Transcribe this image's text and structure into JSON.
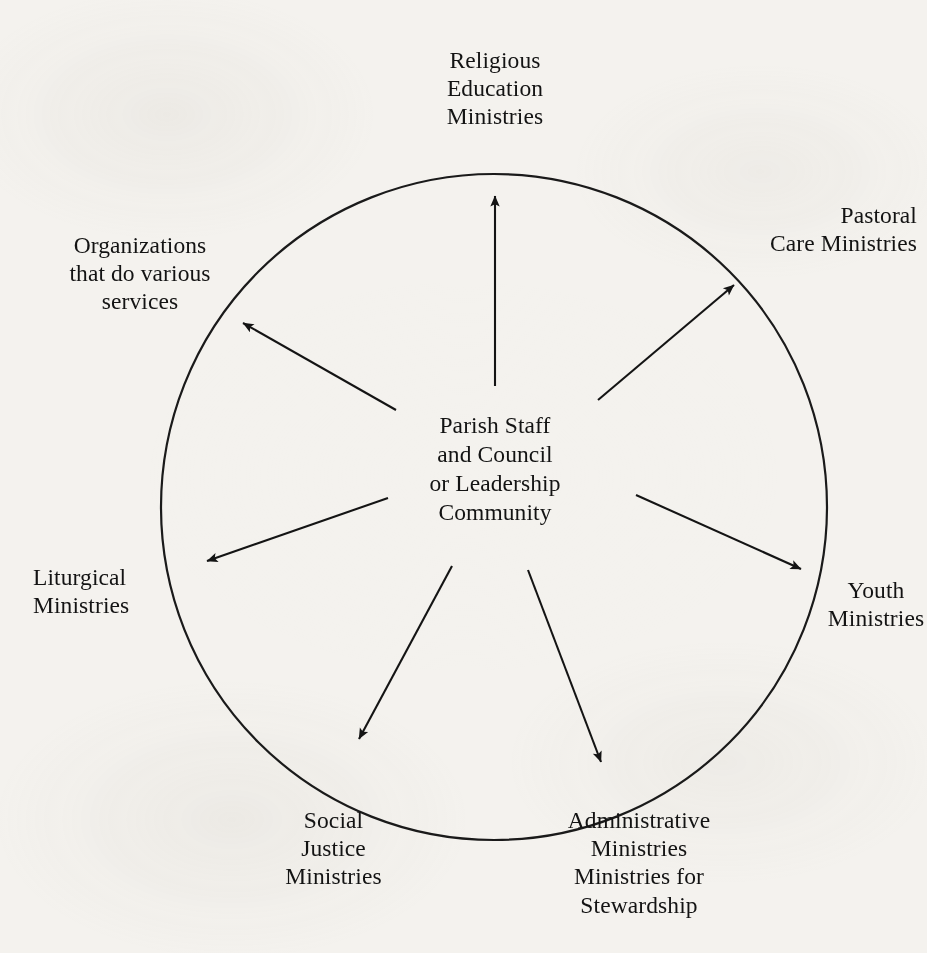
{
  "diagram": {
    "center": {
      "id": "parish-staff-council",
      "text": "Parish Staff\nand Council\nor Leadership\nCommunity",
      "lines": [
        "Parish Staff",
        "and Council",
        "or Leadership",
        "Community"
      ]
    },
    "circle": {
      "shape": "circle",
      "center_x": 494,
      "center_y": 507,
      "radius": 333,
      "stroke_color": "#1a1a1a",
      "stroke_width": 2,
      "fill": "none"
    },
    "colors": {
      "ink": "#131313",
      "stroke": "#1a1a1a",
      "paper": "#f4f2ee"
    },
    "spokes": [
      {
        "id": "religious-education-ministries",
        "label": "Religious\nEducation\nMinistries",
        "lines": [
          "Religious",
          "Education",
          "Ministries"
        ],
        "align": "center",
        "angle_deg": 90,
        "arrow": {
          "x1": 495,
          "y1": 386,
          "x2": 495,
          "y2": 196
        }
      },
      {
        "id": "pastoral-care-ministries",
        "label": "Pastoral\nCare Ministries",
        "lines": [
          "Pastoral",
          "Care Ministries"
        ],
        "align": "right",
        "angle_deg": 45,
        "arrow": {
          "x1": 598,
          "y1": 400,
          "x2": 734,
          "y2": 285
        }
      },
      {
        "id": "youth-ministries",
        "label": "Youth\nMinistries",
        "lines": [
          "Youth",
          "Ministries"
        ],
        "align": "center",
        "angle_deg": 0,
        "arrow": {
          "x1": 636,
          "y1": 495,
          "x2": 801,
          "y2": 569
        }
      },
      {
        "id": "administrative-ministries-stewardship",
        "label": "Administrative\nMinistries\nMinistries for\nStewardship",
        "lines": [
          "Administrative",
          "Ministries",
          "Ministries for",
          "Stewardship"
        ],
        "align": "center",
        "angle_deg": -65,
        "arrow": {
          "x1": 528,
          "y1": 570,
          "x2": 601,
          "y2": 762
        }
      },
      {
        "id": "social-justice-ministries",
        "label": "Social\nJustice\nMinistries",
        "lines": [
          "Social",
          "Justice",
          "Ministries"
        ],
        "align": "center",
        "angle_deg": -115,
        "arrow": {
          "x1": 452,
          "y1": 566,
          "x2": 359,
          "y2": 739
        }
      },
      {
        "id": "liturgical-ministries",
        "label": "Liturgical\nMinistries",
        "lines": [
          "Liturgical",
          "Ministries"
        ],
        "align": "left",
        "angle_deg": 180,
        "arrow": {
          "x1": 388,
          "y1": 498,
          "x2": 207,
          "y2": 561
        }
      },
      {
        "id": "organizations-various-services",
        "label": "Organizations\nthat do various\nservices",
        "lines": [
          "Organizations",
          "that do various",
          "services"
        ],
        "align": "center",
        "angle_deg": 135,
        "arrow": {
          "x1": 396,
          "y1": 410,
          "x2": 243,
          "y2": 323
        }
      }
    ]
  }
}
